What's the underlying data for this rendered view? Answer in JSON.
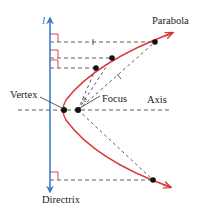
{
  "diagram": {
    "labels": {
      "parabola": "Parabola",
      "focus": "Focus",
      "axis": "Axis",
      "vertex": "Vertex",
      "directrix": "Directrix",
      "directrix_symbol": "l"
    },
    "colors": {
      "parabola": "#d9363e",
      "directrix": "#3b7fc4",
      "dashed": "#333333",
      "right_angle": "#d9363e",
      "points": "#111111"
    },
    "points": {
      "vertex": [
        64,
        110
      ],
      "focus": [
        78,
        110
      ],
      "parabola_points": [
        [
          155,
          42
        ],
        [
          112,
          58
        ],
        [
          96,
          68
        ],
        [
          153,
          180
        ]
      ]
    }
  }
}
